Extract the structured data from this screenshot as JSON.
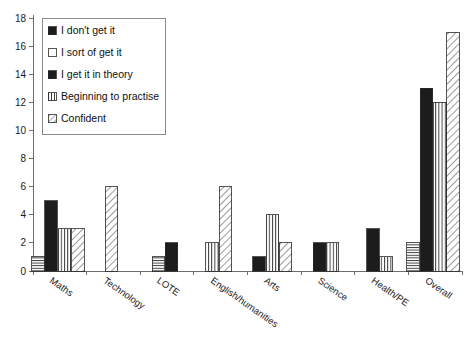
{
  "chart_data": {
    "type": "bar",
    "title": "",
    "subtitle": "",
    "xlabel": "",
    "ylabel": "",
    "ylim": [
      0,
      18
    ],
    "ytick_step": 2,
    "yticks": [
      "0",
      "2",
      "4",
      "6",
      "8",
      "10",
      "12",
      "14",
      "16",
      "18"
    ],
    "grid": false,
    "legend_position": "top-left inside plot",
    "categories": [
      "Maths",
      "Technology",
      "LOTE",
      "English/humanities",
      "Arts",
      "Science",
      "Health/PE",
      "Overall"
    ],
    "series": [
      {
        "name": "I don't get it",
        "pattern": "horizontal-lines",
        "values": [
          1,
          0,
          1,
          0,
          0,
          0,
          0,
          2
        ]
      },
      {
        "name": "I sort of get it",
        "pattern": "solid-black",
        "values": [
          5,
          0,
          2,
          0,
          1,
          2,
          3,
          13
        ]
      },
      {
        "name": "I get it in theory",
        "pattern": "vertical-lines",
        "values": [
          3,
          0,
          0,
          2,
          4,
          2,
          1,
          12
        ]
      },
      {
        "name": "Beginning to practise",
        "pattern": "diagonal-lines",
        "values": [
          3,
          6,
          0,
          6,
          2,
          0,
          0,
          17
        ]
      },
      {
        "name": "Confident",
        "pattern": "diagonal-lines-light",
        "values": [
          0,
          0,
          0,
          0,
          0,
          0,
          0,
          0
        ]
      }
    ]
  },
  "legend": {
    "items": [
      {
        "label": "I don't get it",
        "swatch": "solid-black-swatch"
      },
      {
        "label": "I sort of get it",
        "swatch": "empty-white-swatch"
      },
      {
        "label": "I get it in theory",
        "swatch": "solid-black-swatch"
      },
      {
        "label": "Beginning to practise",
        "swatch": "vertical-lines-swatch"
      },
      {
        "label": "Confident",
        "swatch": "diagonal-lines-swatch"
      }
    ]
  },
  "axes": {
    "y": {
      "ticks": [
        "18",
        "16",
        "14",
        "12",
        "10",
        "8",
        "6",
        "4",
        "2",
        "0"
      ]
    },
    "x": {
      "ticks": [
        "Maths",
        "Technology",
        "LOTE",
        "English/humanities",
        "Arts",
        "Science",
        "Health/PE",
        "Overall"
      ]
    }
  },
  "colors": {
    "background": "#ffffff",
    "axis": "#6e6e6e",
    "bar_outline": "#2a2a2a",
    "bar_fill_solid": "#1c1c1c",
    "text": "#1a1a1a",
    "legend_border": "#8a8a8a"
  }
}
